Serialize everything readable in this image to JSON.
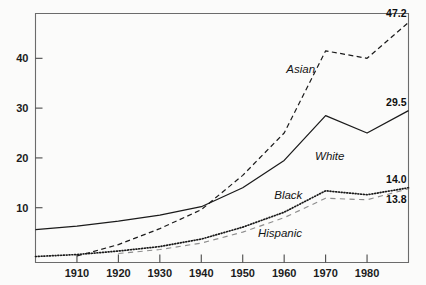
{
  "chart_data": {
    "type": "line",
    "title": "",
    "xlabel": "",
    "ylabel": "",
    "xlim": [
      1900,
      1990
    ],
    "ylim": [
      -1,
      49
    ],
    "grid": false,
    "legend_position": "inline-annotations",
    "x_ticks": [
      "1910",
      "1920",
      "1930",
      "1940",
      "1950",
      "1960",
      "1970",
      "1980"
    ],
    "x_tick_values": [
      1910,
      1920,
      1930,
      1940,
      1950,
      1960,
      1970,
      1980
    ],
    "y_ticks": [
      "10",
      "20",
      "30",
      "40"
    ],
    "y_tick_values": [
      10,
      20,
      30,
      40
    ],
    "x": [
      1900,
      1910,
      1920,
      1930,
      1940,
      1950,
      1960,
      1970,
      1980,
      1990
    ],
    "series": [
      {
        "name": "Asian",
        "style": "dashed",
        "color": "#1a1a1a",
        "values": [
          null,
          0.3,
          2.6,
          5.8,
          9.6,
          16.5,
          25.0,
          41.5,
          40.0,
          47.2
        ],
        "end_label": "47.2",
        "label_x": 1964,
        "label_y": 37.0
      },
      {
        "name": "White",
        "style": "solid",
        "color": "#1a1a1a",
        "values": [
          5.6,
          6.3,
          7.3,
          8.5,
          10.2,
          14.0,
          19.5,
          28.5,
          25.0,
          29.5
        ],
        "end_label": "29.5",
        "label_x": 1971,
        "label_y": 19.5
      },
      {
        "name": "Black",
        "style": "dotted",
        "color": "#1a1a1a",
        "values": [
          0.2,
          0.6,
          1.3,
          2.2,
          3.7,
          6.1,
          9.1,
          13.4,
          12.6,
          14.0
        ],
        "end_label": "14.0",
        "label_x": 1961,
        "label_y": 11.8
      },
      {
        "name": "Hispanic",
        "style": "dashed-light",
        "color": "#8d8d8d",
        "values": [
          null,
          null,
          0.8,
          1.6,
          2.9,
          5.1,
          8.0,
          11.9,
          11.6,
          13.8
        ],
        "end_label": "13.8",
        "label_x": 1959,
        "label_y": 4.2
      }
    ]
  }
}
